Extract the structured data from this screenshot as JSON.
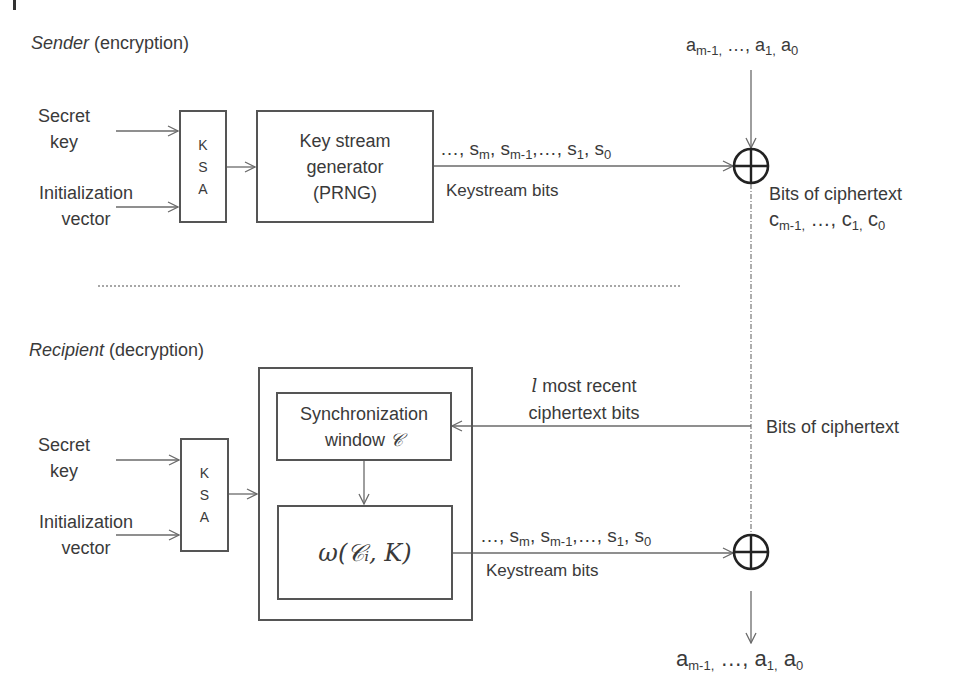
{
  "sender": {
    "section_title_italic": "Sender",
    "section_title_rest": " (encryption)",
    "inputs": {
      "secret_key": [
        "Secret",
        "key"
      ],
      "iv": [
        "Initialization",
        "vector"
      ]
    },
    "ksa": {
      "letters": [
        "K",
        "S",
        "A"
      ]
    },
    "generator": {
      "lines": [
        "Key stream",
        "generator",
        "(PRNG)"
      ]
    },
    "keystream_seq": {
      "prefix": "…, s",
      "sub_m": "m",
      "mid1": ", s",
      "sub_m1": "m-1",
      "mid2": ",…, s",
      "sub_1": "1",
      "mid3": ", s",
      "sub_0": "0"
    },
    "keystream_label": "Keystream bits",
    "plaintext_in": {
      "a": "a",
      "sub_m1": "m-1,",
      "mid": " …, a",
      "sub_1": "1,",
      "mid2": " a",
      "sub_0": "0"
    },
    "ciphertext_out": {
      "line1": "Bits of ciphertext",
      "c": "c",
      "sub_m1": "m-1,",
      "mid": " …, c",
      "sub_1": "1,",
      "mid2": " c",
      "sub_0": "0"
    },
    "xor_symbol": "xor-operator"
  },
  "separator": "dotted-line",
  "recipient": {
    "section_title_italic": "Recipient",
    "section_title_rest": " (decryption)",
    "inputs": {
      "secret_key": [
        "Secret",
        "key"
      ],
      "iv": [
        "Initialization",
        "vector"
      ]
    },
    "ksa": {
      "letters": [
        "K",
        "S",
        "A"
      ]
    },
    "sync_window": {
      "line1": "Synchronization",
      "line2_text": "window ",
      "line2_math": "𝒞"
    },
    "omega_function": "ω(𝒞ᵢ, K)",
    "feedback_label": {
      "var": "l",
      "line1_rest": " most recent",
      "line2": "ciphertext bits"
    },
    "ciphertext_in_label": "Bits of ciphertext",
    "keystream_seq": {
      "prefix": "…, s",
      "sub_m": "m",
      "mid1": ", s",
      "sub_m1": "m-1",
      "mid2": ",…, s",
      "sub_1": "1",
      "mid3": ", s",
      "sub_0": "0"
    },
    "keystream_label": "Keystream bits",
    "plaintext_out": {
      "a": "a",
      "sub_m1": "m-1,",
      "mid": " …, a",
      "sub_1": "1,",
      "mid2": " a",
      "sub_0": "0"
    },
    "xor_symbol": "xor-operator"
  },
  "colors": {
    "line": "#6a6a6a",
    "box_border": "#555555",
    "xor": "#222222",
    "text": "#3a3a3a"
  }
}
